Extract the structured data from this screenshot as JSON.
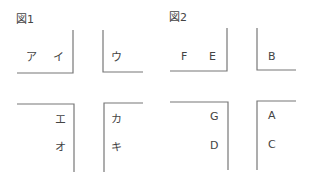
{
  "figures": [
    {
      "title": "図1",
      "quadrants": {
        "top_left": [
          "ア",
          "イ"
        ],
        "top_right": [
          "ウ"
        ],
        "bottom_left": [
          "エ",
          "オ"
        ],
        "bottom_right": [
          "カ",
          "キ"
        ]
      }
    },
    {
      "title": "図2",
      "quadrants": {
        "top_left": [
          "F",
          "E"
        ],
        "top_right": [
          "B"
        ],
        "bottom_left": [
          "G",
          "D"
        ],
        "bottom_right": [
          "A",
          "C"
        ]
      }
    }
  ],
  "colors": {
    "line": "#777777",
    "text": "#444444"
  }
}
